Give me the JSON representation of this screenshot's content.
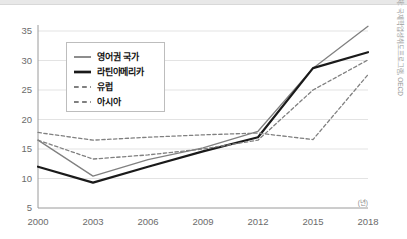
{
  "chart_data": {
    "type": "line",
    "title": "",
    "subtitle": "",
    "xlabel": "(년)",
    "ylabel": "",
    "x": [
      2000,
      2003,
      2006,
      2009,
      2012,
      2015,
      2018
    ],
    "categories": [
      "2000",
      "2003",
      "2006",
      "2009",
      "2012",
      "2015",
      "2018"
    ],
    "xlim": [
      2000,
      2018
    ],
    "ylim": [
      5,
      35
    ],
    "yticks": [
      5,
      10,
      15,
      20,
      25,
      30,
      35
    ],
    "ytick_labels": [
      "5",
      "10",
      "15",
      "20",
      "25",
      "30",
      "35"
    ],
    "xticks": [
      2000,
      2003,
      2006,
      2009,
      2012,
      2015,
      2018
    ],
    "xtick_labels": [
      "2000",
      "2003",
      "2006",
      "2009",
      "2012",
      "2015",
      "2018"
    ],
    "grid": true,
    "grid_axis": "y",
    "legend_position": "upper-left",
    "series": [
      {
        "name": "영어권 국가",
        "values": [
          16.5,
          10.4,
          13.2,
          15.2,
          18.0,
          28.7,
          35.8
        ],
        "color": "#808080",
        "style": "solid",
        "width": 1.3
      },
      {
        "name": "라틴아메리카",
        "values": [
          12.0,
          9.3,
          12.0,
          14.6,
          17.0,
          28.7,
          31.4
        ],
        "color": "#1a1a1a",
        "style": "solid",
        "width": 2.2
      },
      {
        "name": "유럽",
        "values": [
          16.5,
          13.3,
          14.0,
          15.0,
          16.5,
          25.0,
          30.1
        ],
        "color": "#808080",
        "style": "dashed",
        "width": 1.3
      },
      {
        "name": "아시아",
        "values": [
          17.8,
          16.5,
          17.0,
          17.4,
          17.7,
          16.6,
          27.6
        ],
        "color": "#808080",
        "style": "dashed",
        "width": 1.3
      }
    ]
  },
  "legend": {
    "entries": [
      "영어권 국가",
      "라틴아메리카",
      "유럽",
      "아시아"
    ]
  },
  "source_note": "출처: 국제학업성취도프로그램, OECD",
  "axis_unit_label": "(년)"
}
